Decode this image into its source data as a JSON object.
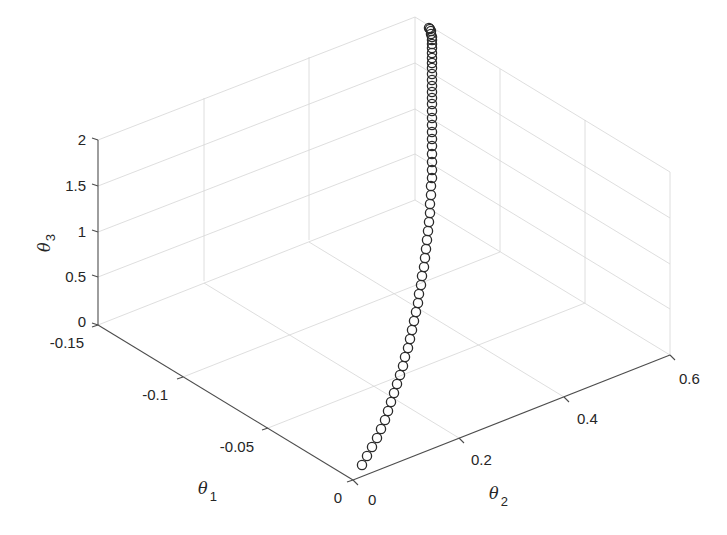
{
  "chart_data": {
    "type": "scatter3d",
    "title": "",
    "xlabel": "θ1",
    "ylabel": "θ2",
    "zlabel": "θ3",
    "xlim": [
      -0.15,
      0
    ],
    "ylim": [
      0,
      0.6
    ],
    "zlim": [
      0,
      2
    ],
    "grid": true,
    "marker": "o",
    "marker_color": "#2a2a2a",
    "x_ticks": [
      "-0.15",
      "-0.1",
      "-0.05",
      "0"
    ],
    "y_ticks": [
      "0",
      "0.2",
      "0.4",
      "0.6"
    ],
    "z_ticks": [
      "0",
      "0.5",
      "1",
      "1.5",
      "2"
    ],
    "series": [
      {
        "name": "trajectory",
        "points_screen_px": [
          [
            362,
            465
          ],
          [
            367,
            456
          ],
          [
            372,
            447
          ],
          [
            377,
            438
          ],
          [
            381,
            429
          ],
          [
            385,
            420
          ],
          [
            388,
            411
          ],
          [
            391,
            402
          ],
          [
            394,
            393
          ],
          [
            397,
            384
          ],
          [
            400,
            375
          ],
          [
            403,
            366
          ],
          [
            405,
            357
          ],
          [
            408,
            348
          ],
          [
            410,
            339
          ],
          [
            412,
            330
          ],
          [
            414,
            321
          ],
          [
            416,
            312
          ],
          [
            418,
            303
          ],
          [
            419,
            294
          ],
          [
            421,
            285
          ],
          [
            422,
            276
          ],
          [
            424,
            267
          ],
          [
            425,
            258
          ],
          [
            426,
            249
          ],
          [
            427,
            240
          ],
          [
            428,
            231
          ],
          [
            429,
            222
          ],
          [
            430,
            213
          ],
          [
            430,
            204
          ],
          [
            431,
            195
          ],
          [
            431,
            186
          ],
          [
            432,
            178
          ],
          [
            432,
            170
          ],
          [
            432,
            162
          ],
          [
            432,
            154
          ],
          [
            432,
            146
          ],
          [
            432,
            139
          ],
          [
            432,
            132
          ],
          [
            432,
            125
          ],
          [
            432,
            118
          ],
          [
            432,
            111
          ],
          [
            432,
            104
          ],
          [
            432,
            98
          ],
          [
            432,
            92
          ],
          [
            432,
            86
          ],
          [
            432,
            80
          ],
          [
            432,
            74
          ],
          [
            432,
            68
          ],
          [
            432,
            63
          ],
          [
            432,
            58
          ],
          [
            432,
            53
          ],
          [
            432,
            48
          ],
          [
            432,
            44
          ],
          [
            432,
            40
          ],
          [
            432,
            37
          ],
          [
            431,
            34
          ],
          [
            431,
            31
          ],
          [
            430,
            29
          ],
          [
            429,
            28
          ]
        ]
      }
    ]
  },
  "axes": {
    "z_label": "θ",
    "z_label_sub": "3",
    "x_label": "θ",
    "x_label_sub": "1",
    "y_label": "θ",
    "y_label_sub": "2",
    "z_ticks": [
      "2",
      "1.5",
      "1",
      "0.5",
      "0"
    ],
    "x_ticks": [
      "-0.15",
      "-0.1",
      "-0.05",
      "0"
    ],
    "y_ticks": [
      "0",
      "0.2",
      "0.4",
      "0.6"
    ]
  }
}
